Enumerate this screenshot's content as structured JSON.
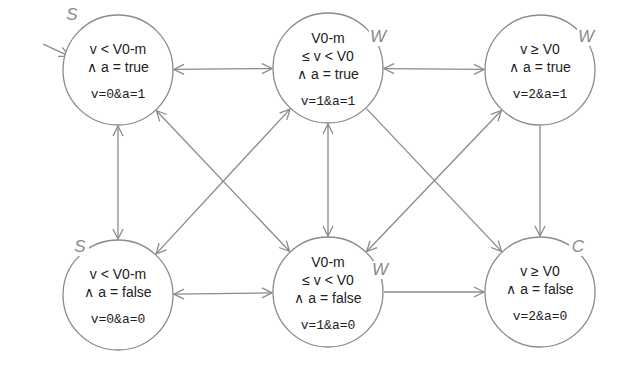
{
  "diagram": {
    "type": "state-machine",
    "colors": {
      "stroke": "#8a8a8a",
      "text": "#222222",
      "tag": "#8a8a8a",
      "background": "#ffffff"
    },
    "initial_state": "s00",
    "states": [
      {
        "id": "s00",
        "tag": "S",
        "lines": [
          "v < V0-m",
          "∧ a = true"
        ],
        "encoding": "v=0&a=1",
        "cx": 118,
        "cy": 70,
        "tagx": 72,
        "tagy": 20
      },
      {
        "id": "s10",
        "tag": "W",
        "lines": [
          "V0-m",
          "≤ v < V0",
          "∧ a = true"
        ],
        "encoding": "v=1&a=1",
        "cx": 328,
        "cy": 68,
        "tagx": 378,
        "tagy": 42
      },
      {
        "id": "s20",
        "tag": "W",
        "lines": [
          "v ≥ V0",
          "∧ a = true"
        ],
        "encoding": "v=2&a=1",
        "cx": 540,
        "cy": 70,
        "tagx": 586,
        "tagy": 42
      },
      {
        "id": "s01",
        "tag": "S",
        "lines": [
          "v < V0-m",
          "∧ a = false"
        ],
        "encoding": "v=0&a=0",
        "cx": 118,
        "cy": 295,
        "tagx": 80,
        "tagy": 252
      },
      {
        "id": "s11",
        "tag": "W",
        "lines": [
          "V0-m",
          "≤ v < V0",
          "∧ a = false"
        ],
        "encoding": "v=1&a=0",
        "cx": 328,
        "cy": 292,
        "tagx": 380,
        "tagy": 275
      },
      {
        "id": "s21",
        "tag": "C",
        "lines": [
          "v ≥ V0",
          "∧ a = false"
        ],
        "encoding": "v=2&a=0",
        "cx": 540,
        "cy": 292,
        "tagx": 578,
        "tagy": 252
      }
    ],
    "edges": [
      {
        "from": "s00",
        "to": "s10",
        "bidirectional": true
      },
      {
        "from": "s10",
        "to": "s20",
        "bidirectional": true
      },
      {
        "from": "s01",
        "to": "s11",
        "bidirectional": true
      },
      {
        "from": "s11",
        "to": "s21",
        "bidirectional": false
      },
      {
        "from": "s00",
        "to": "s01",
        "bidirectional": true
      },
      {
        "from": "s10",
        "to": "s11",
        "bidirectional": true
      },
      {
        "from": "s20",
        "to": "s21",
        "bidirectional": false
      },
      {
        "from": "s00",
        "to": "s11",
        "bidirectional": true
      },
      {
        "from": "s10",
        "to": "s01",
        "bidirectional": true
      },
      {
        "from": "s10",
        "to": "s21",
        "bidirectional": false
      },
      {
        "from": "s11",
        "to": "s20",
        "bidirectional": true
      }
    ]
  }
}
